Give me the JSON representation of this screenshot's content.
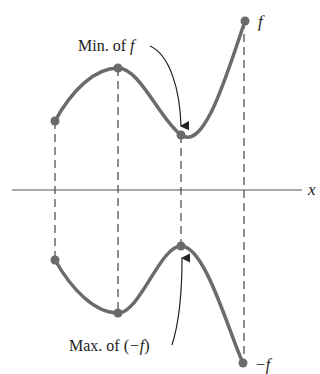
{
  "figure": {
    "upper_curve_label": "f",
    "lower_curve_label": "−f",
    "axis_label": "x",
    "annotation_min": "Min. of f",
    "annotation_min_prefix": "Min. of ",
    "annotation_min_var": "f",
    "annotation_max": "Max. of (−f)",
    "annotation_max_prefix": "Max. of (",
    "annotation_max_var": "−f",
    "annotation_max_suffix": ")"
  },
  "colors": {
    "curve": "#6b6b6b",
    "point": "#6b6b6b",
    "axis": "#555555",
    "dashed": "#444444",
    "text": "#222222"
  },
  "points": {
    "f": [
      {
        "x": 55,
        "y": 121
      },
      {
        "x": 118,
        "y": 68
      },
      {
        "x": 181,
        "y": 135
      },
      {
        "x": 245,
        "y": 21
      }
    ],
    "neg_f": [
      {
        "x": 55,
        "y": 260
      },
      {
        "x": 118,
        "y": 313
      },
      {
        "x": 181,
        "y": 246
      },
      {
        "x": 243,
        "y": 363
      }
    ]
  }
}
